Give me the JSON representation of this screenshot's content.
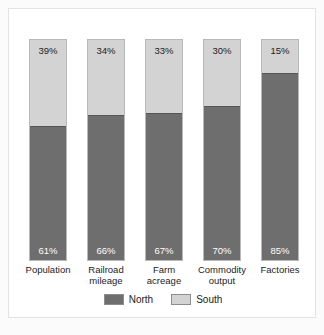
{
  "chart_data": {
    "type": "bar",
    "subtype": "stacked-100-percent",
    "title": "",
    "xlabel": "",
    "ylabel": "",
    "ylim": [
      0,
      100
    ],
    "grid": false,
    "legend_position": "bottom-center",
    "categories": [
      "Population",
      "Railroad mileage",
      "Farm acreage",
      "Commodity output",
      "Factories"
    ],
    "series": [
      {
        "name": "North",
        "color": "#6e6e6e",
        "values": [
          61,
          66,
          67,
          70,
          85
        ],
        "value_labels": [
          "61%",
          "66%",
          "67%",
          "70%",
          "85%"
        ]
      },
      {
        "name": "South",
        "color": "#d3d3d3",
        "values": [
          39,
          34,
          33,
          30,
          15
        ],
        "value_labels": [
          "39%",
          "34%",
          "33%",
          "30%",
          "15%"
        ]
      }
    ],
    "category_label_lines": [
      [
        "Population"
      ],
      [
        "Railroad",
        "mileage"
      ],
      [
        "Farm",
        "acreage"
      ],
      [
        "Commodity",
        "output"
      ],
      [
        "Factories"
      ]
    ]
  },
  "legend": {
    "items": [
      {
        "label": "North",
        "color": "#6e6e6e"
      },
      {
        "label": "South",
        "color": "#d3d3d3"
      }
    ]
  },
  "bars": [
    {
      "category_line1": "Population",
      "category_line2": "",
      "south": "39%",
      "north": "61%",
      "south_pct": 39,
      "north_pct": 61
    },
    {
      "category_line1": "Railroad",
      "category_line2": "mileage",
      "south": "34%",
      "north": "66%",
      "south_pct": 34,
      "north_pct": 66
    },
    {
      "category_line1": "Farm",
      "category_line2": "acreage",
      "south": "33%",
      "north": "67%",
      "south_pct": 33,
      "north_pct": 67
    },
    {
      "category_line1": "Commodity",
      "category_line2": "output",
      "south": "30%",
      "north": "70%",
      "south_pct": 30,
      "north_pct": 70
    },
    {
      "category_line1": "Factories",
      "category_line2": "",
      "south": "15%",
      "north": "85%",
      "south_pct": 15,
      "north_pct": 85
    }
  ]
}
